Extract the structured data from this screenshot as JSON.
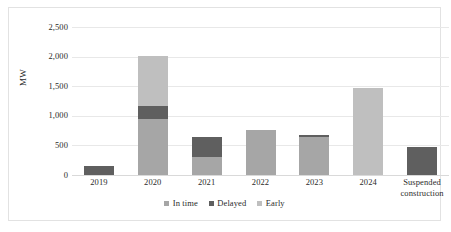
{
  "chart_data": {
    "type": "bar",
    "subtype": "stacked-bar",
    "title": "",
    "xlabel": "",
    "ylabel": "MW",
    "ylim": [
      0,
      2500
    ],
    "yticks": [
      0,
      500,
      1000,
      1500,
      2000,
      2500
    ],
    "ytick_labels": [
      "0",
      "500",
      "1,000",
      "1,500",
      "2,000",
      "2,500"
    ],
    "grid": true,
    "legend_position": "bottom",
    "categories": [
      "2019",
      "2020",
      "2021",
      "2022",
      "2023",
      "2024",
      "Suspended construction"
    ],
    "series": [
      {
        "name": "In time",
        "color": "#a6a6a6",
        "values": [
          0,
          940,
          310,
          755,
          650,
          0,
          0
        ]
      },
      {
        "name": "Delayed",
        "color": "#5f5f5f",
        "values": [
          145,
          225,
          340,
          0,
          25,
          0,
          465
        ]
      },
      {
        "name": "Early",
        "color": "#bfbfbf",
        "values": [
          0,
          845,
          0,
          0,
          0,
          1470,
          0
        ]
      }
    ],
    "totals": [
      145,
      2010,
      650,
      755,
      675,
      1470,
      465
    ]
  },
  "axis": {
    "y_title": "MW"
  },
  "legend": {
    "items": [
      {
        "label": "In time",
        "color": "#a6a6a6"
      },
      {
        "label": "Delayed",
        "color": "#5f5f5f"
      },
      {
        "label": "Early",
        "color": "#bfbfbf"
      }
    ]
  },
  "colors": {
    "gridline": "#e8e8e8",
    "border": "#e2e2e2",
    "text": "#2b2b2b",
    "background": "#ffffff"
  }
}
